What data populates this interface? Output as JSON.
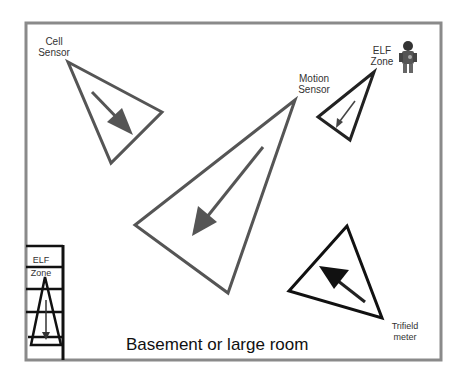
{
  "diagram": {
    "title": "Basement or large room",
    "colors": {
      "room_border": "#8a8a8a",
      "shape_stroke": "#3a3a3a",
      "arrow_fill": "#4a4a4a",
      "background": "#ffffff"
    },
    "labels": {
      "cell_sensor": [
        "Cell",
        "Sensor"
      ],
      "motion_sensor": [
        "Motion",
        "Sensor"
      ],
      "elf_zone_top": [
        "ELF",
        "Zone"
      ],
      "elf_zone_stairs": [
        "ELF",
        "Zone"
      ],
      "trifield_meter": [
        "Trifield",
        "meter"
      ]
    },
    "icons": {
      "person": "ghost-hunter-figure-icon"
    }
  }
}
